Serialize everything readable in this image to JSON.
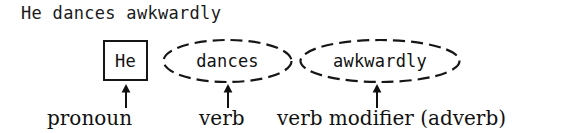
{
  "figure": {
    "sentence": "He dances awkwardly",
    "nodes": [
      {
        "text": "He",
        "shape": "rectangle-solid",
        "icon": "solid-rectangle-outline"
      },
      {
        "text": "dances",
        "shape": "ellipse-dashed",
        "icon": "dashed-ellipse-outline"
      },
      {
        "text": "awkwardly",
        "shape": "ellipse-dashed",
        "icon": "dashed-ellipse-outline"
      }
    ],
    "arrows": [
      {
        "icon": "up-arrow-icon",
        "points_to": "He"
      },
      {
        "icon": "up-arrow-icon",
        "points_to": "dances"
      },
      {
        "icon": "up-arrow-icon",
        "points_to": "awkwardly"
      }
    ],
    "captions": [
      {
        "label": "pronoun"
      },
      {
        "label": "verb"
      },
      {
        "label": "verb modifier (adverb)"
      }
    ],
    "colors": {
      "ink": "#111111",
      "background": "#ffffff"
    }
  }
}
